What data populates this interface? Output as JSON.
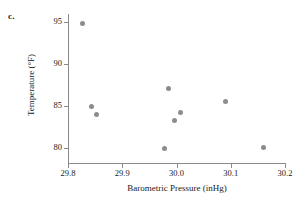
{
  "panel": {
    "letter": "c."
  },
  "chart_data": {
    "type": "scatter",
    "title": "",
    "xlabel": "Barometric Pressure (inHg)",
    "ylabel": "Temperature (°F)",
    "xlim": [
      29.76,
      30.2
    ],
    "ylim": [
      78.5,
      95.5
    ],
    "xticks": [
      29.8,
      29.9,
      30.0,
      30.1,
      30.2
    ],
    "xtick_labels": [
      "29.8",
      "29.9",
      "30.0",
      "30.1",
      "30.2"
    ],
    "yticks": [
      80,
      85,
      90,
      95
    ],
    "ytick_labels": [
      "80",
      "85",
      "90",
      "95"
    ],
    "grid": false,
    "legend": false,
    "marker_color": "#8c8c8c",
    "axis_color": "#8a8a8a",
    "points": [
      {
        "x": 29.826,
        "y": 94.8
      },
      {
        "x": 29.844,
        "y": 84.9
      },
      {
        "x": 29.853,
        "y": 84.0
      },
      {
        "x": 29.977,
        "y": 80.0
      },
      {
        "x": 29.986,
        "y": 87.1
      },
      {
        "x": 29.997,
        "y": 83.3
      },
      {
        "x": 30.008,
        "y": 84.2
      },
      {
        "x": 30.091,
        "y": 85.5
      },
      {
        "x": 30.161,
        "y": 80.1
      }
    ]
  }
}
